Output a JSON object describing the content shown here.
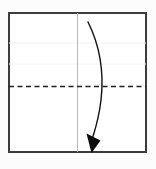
{
  "figure": {
    "type": "fold-diagram",
    "caption": ""
  },
  "canvas": {
    "width": 156,
    "height": 169,
    "background_color": "#fcfcfc"
  },
  "paper": {
    "name": "square-sheet",
    "x": 8,
    "y": 12,
    "width": 139,
    "height": 141,
    "fill_color": "#ffffff",
    "border_color": "#3c3c3c",
    "border_width": 2
  },
  "creases": [
    {
      "name": "existing-crease-upper",
      "style": "solid-faint",
      "orientation": "horizontal",
      "x1": 9,
      "y1": 43,
      "x2": 146,
      "y2": 43,
      "color": "#efefef",
      "width": 1
    },
    {
      "name": "existing-crease-lower",
      "style": "solid-faint",
      "orientation": "horizontal",
      "x1": 9,
      "y1": 64,
      "x2": 146,
      "y2": 64,
      "color": "#f4f4f4",
      "width": 1
    },
    {
      "name": "center-line-vertical",
      "style": "solid-light",
      "orientation": "vertical",
      "x1": 77.5,
      "y1": 13,
      "x2": 77.5,
      "y2": 152,
      "color": "#b9b9b9",
      "width": 1
    },
    {
      "name": "valley-fold-line",
      "style": "dashed",
      "orientation": "horizontal",
      "x1": 9,
      "y1": 86.5,
      "x2": 146,
      "y2": 86.5,
      "color": "#1f1f1f",
      "width": 1.6,
      "dash_pattern": "5,3.5"
    }
  ],
  "arrow": {
    "name": "fold-direction-arrow",
    "direction": "downward-curved",
    "color": "#111111",
    "stroke_width": 1.4,
    "path": "M 88 22 C 100 46, 104 74, 101 100 C 99 118, 95 130, 92.5 138",
    "start_point": [
      88,
      22
    ],
    "end_point": [
      92.5,
      138
    ],
    "control_bulge_x": 102,
    "head": {
      "name": "arrowhead",
      "shape": "filled-triangle",
      "points": "91.5,153 86.5,133.5 100.5,140.5",
      "fill_color": "#0d0d0d"
    }
  }
}
